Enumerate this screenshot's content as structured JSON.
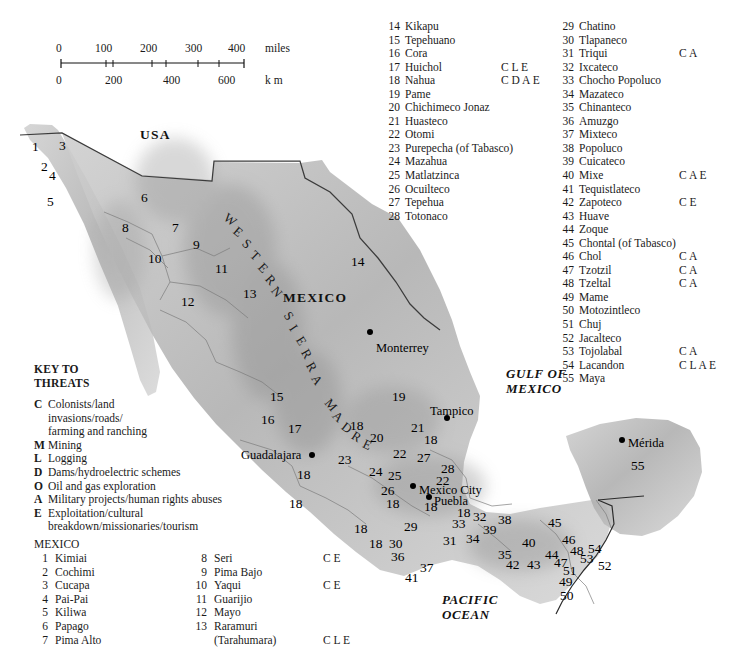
{
  "scale": {
    "miles_label": "miles",
    "km_label": "k m",
    "miles_ticks": [
      "0",
      "100",
      "200",
      "300",
      "400"
    ],
    "km_ticks": [
      "0",
      "200",
      "400",
      "600"
    ]
  },
  "threats_key": {
    "heading_line1": "KEY TO",
    "heading_line2": "THREATS",
    "items": [
      {
        "code": "C",
        "label": "Colonists/land",
        "cont": [
          "invasions/roads/",
          "farming and ranching"
        ]
      },
      {
        "code": "M",
        "label": "Mining",
        "cont": []
      },
      {
        "code": "L",
        "label": "Logging",
        "cont": []
      },
      {
        "code": "D",
        "label": "Dams/hydroelectric schemes",
        "cont": []
      },
      {
        "code": "O",
        "label": "Oil and gas exploration",
        "cont": []
      },
      {
        "code": "A",
        "label": "Military projects/human rights abuses",
        "cont": []
      },
      {
        "code": "E",
        "label": "Exploitation/cultural",
        "cont": [
          "breakdown/missionaries/tourism"
        ]
      }
    ]
  },
  "peoples": {
    "country_heading": "MEXICO",
    "col_bottom_left": [
      {
        "num": "1",
        "name": "Kimiai",
        "threats": ""
      },
      {
        "num": "2",
        "name": "Cochimi",
        "threats": ""
      },
      {
        "num": "3",
        "name": "Cucapa",
        "threats": ""
      },
      {
        "num": "4",
        "name": "Pai-Pai",
        "threats": ""
      },
      {
        "num": "5",
        "name": "Kiliwa",
        "threats": ""
      },
      {
        "num": "6",
        "name": "Papago",
        "threats": ""
      },
      {
        "num": "7",
        "name": "Pima Alto",
        "threats": ""
      }
    ],
    "col_bottom_mid": [
      {
        "num": "8",
        "name": "Seri",
        "threats": "C E"
      },
      {
        "num": "9",
        "name": "Pima Bajo",
        "threats": ""
      },
      {
        "num": "10",
        "name": "Yaqui",
        "threats": "C E"
      },
      {
        "num": "11",
        "name": "Guarijio",
        "threats": ""
      },
      {
        "num": "12",
        "name": "Mayo",
        "threats": ""
      },
      {
        "num": "13",
        "name": "Raramuri",
        "threats": ""
      },
      {
        "num": "",
        "name": "(Tarahumara)",
        "threats": "C L E"
      }
    ],
    "col_top_left": [
      {
        "num": "14",
        "name": "Kikapu",
        "threats": ""
      },
      {
        "num": "15",
        "name": "Tepehuano",
        "threats": ""
      },
      {
        "num": "16",
        "name": "Cora",
        "threats": ""
      },
      {
        "num": "17",
        "name": "Huichol",
        "threats": "C L E"
      },
      {
        "num": "18",
        "name": "Nahua",
        "threats": "C D A E"
      },
      {
        "num": "19",
        "name": "Pame",
        "threats": ""
      },
      {
        "num": "20",
        "name": "Chichimeco Jonaz",
        "threats": ""
      },
      {
        "num": "21",
        "name": "Huasteco",
        "threats": ""
      },
      {
        "num": "22",
        "name": "Otomi",
        "threats": ""
      },
      {
        "num": "23",
        "name": "Purepecha (of Tabasco)",
        "threats": ""
      },
      {
        "num": "24",
        "name": "Mazahua",
        "threats": ""
      },
      {
        "num": "25",
        "name": "Matlatzinca",
        "threats": ""
      },
      {
        "num": "26",
        "name": "Ocuilteco",
        "threats": ""
      },
      {
        "num": "27",
        "name": "Tepehua",
        "threats": ""
      },
      {
        "num": "28",
        "name": "Totonaco",
        "threats": ""
      }
    ],
    "col_top_right": [
      {
        "num": "29",
        "name": "Chatino",
        "threats": ""
      },
      {
        "num": "30",
        "name": "Tlapaneco",
        "threats": ""
      },
      {
        "num": "31",
        "name": "Triqui",
        "threats": "C A"
      },
      {
        "num": "32",
        "name": "Ixcateco",
        "threats": ""
      },
      {
        "num": "33",
        "name": "Chocho Popoluco",
        "threats": ""
      },
      {
        "num": "34",
        "name": "Mazateco",
        "threats": ""
      },
      {
        "num": "35",
        "name": "Chinanteco",
        "threats": ""
      },
      {
        "num": "36",
        "name": "Amuzgo",
        "threats": ""
      },
      {
        "num": "37",
        "name": "Mixteco",
        "threats": ""
      },
      {
        "num": "38",
        "name": "Popoluco",
        "threats": ""
      },
      {
        "num": "39",
        "name": "Cuicateco",
        "threats": ""
      },
      {
        "num": "40",
        "name": "Mixe",
        "threats": "C A E"
      },
      {
        "num": "41",
        "name": "Tequistlateco",
        "threats": ""
      },
      {
        "num": "42",
        "name": "Zapoteco",
        "threats": "C E"
      },
      {
        "num": "43",
        "name": "Huave",
        "threats": ""
      },
      {
        "num": "44",
        "name": "Zoque",
        "threats": ""
      },
      {
        "num": "45",
        "name": "Chontal (of Tabasco)",
        "threats": ""
      },
      {
        "num": "46",
        "name": "Chol",
        "threats": "C A"
      },
      {
        "num": "47",
        "name": "Tzotzil",
        "threats": "C A"
      },
      {
        "num": "48",
        "name": "Tzeltal",
        "threats": "C A"
      },
      {
        "num": "49",
        "name": "Mame",
        "threats": ""
      },
      {
        "num": "50",
        "name": "Motozintleco",
        "threats": ""
      },
      {
        "num": "51",
        "name": "Chuj",
        "threats": ""
      },
      {
        "num": "52",
        "name": "Jacalteco",
        "threats": ""
      },
      {
        "num": "53",
        "name": "Tojolabal",
        "threats": "C A"
      },
      {
        "num": "54",
        "name": "Lacandon",
        "threats": "C L A E"
      },
      {
        "num": "55",
        "name": "Maya",
        "threats": ""
      }
    ]
  },
  "map_labels": {
    "countries": [
      {
        "text": "USA",
        "x": 140,
        "y": 127
      },
      {
        "text": "MEXICO",
        "x": 283,
        "y": 290
      }
    ],
    "oceans": [
      {
        "line1": "GULF OF",
        "line2": "MEXICO",
        "x": 506,
        "y": 366
      },
      {
        "line1": "PACIFIC",
        "line2": "OCEAN",
        "x": 442,
        "y": 592
      }
    ],
    "range_name": "WESTERN SIERRA MADRE",
    "cities": [
      {
        "name": "Monterrey",
        "x": 376,
        "y": 341,
        "dot_x": 367,
        "dot_y": 329
      },
      {
        "name": "Tampico",
        "x": 430,
        "y": 404,
        "dot_x": 444,
        "dot_y": 415
      },
      {
        "name": "Guadalajara",
        "x": 241,
        "y": 448,
        "dot_x": 309,
        "dot_y": 452
      },
      {
        "name": "Mexico City",
        "x": 419,
        "y": 483,
        "dot_x": 410,
        "dot_y": 483
      },
      {
        "name": "Puebla",
        "x": 434,
        "y": 494,
        "dot_x": 426,
        "dot_y": 494
      },
      {
        "name": "Mérida",
        "x": 628,
        "y": 436,
        "dot_x": 619,
        "dot_y": 437
      }
    ],
    "numbers": [
      {
        "n": "1",
        "x": 32,
        "y": 139
      },
      {
        "n": "2",
        "x": 41,
        "y": 159
      },
      {
        "n": "3",
        "x": 59,
        "y": 138
      },
      {
        "n": "4",
        "x": 49,
        "y": 168
      },
      {
        "n": "5",
        "x": 47,
        "y": 194
      },
      {
        "n": "6",
        "x": 141,
        "y": 190
      },
      {
        "n": "7",
        "x": 172,
        "y": 220
      },
      {
        "n": "8",
        "x": 122,
        "y": 220
      },
      {
        "n": "9",
        "x": 193,
        "y": 237
      },
      {
        "n": "10",
        "x": 148,
        "y": 251
      },
      {
        "n": "11",
        "x": 215,
        "y": 261
      },
      {
        "n": "12",
        "x": 181,
        "y": 294
      },
      {
        "n": "13",
        "x": 243,
        "y": 286
      },
      {
        "n": "14",
        "x": 351,
        "y": 254
      },
      {
        "n": "15",
        "x": 270,
        "y": 389
      },
      {
        "n": "16",
        "x": 261,
        "y": 412
      },
      {
        "n": "17",
        "x": 288,
        "y": 421
      },
      {
        "n": "18",
        "x": 350,
        "y": 418
      },
      {
        "n": "19",
        "x": 392,
        "y": 389
      },
      {
        "n": "20",
        "x": 370,
        "y": 430
      },
      {
        "n": "21",
        "x": 411,
        "y": 420
      },
      {
        "n": "18",
        "x": 424,
        "y": 432
      },
      {
        "n": "22",
        "x": 393,
        "y": 446
      },
      {
        "n": "27",
        "x": 417,
        "y": 450
      },
      {
        "n": "23",
        "x": 338,
        "y": 452
      },
      {
        "n": "18",
        "x": 297,
        "y": 467
      },
      {
        "n": "24",
        "x": 369,
        "y": 464
      },
      {
        "n": "25",
        "x": 388,
        "y": 468
      },
      {
        "n": "28",
        "x": 441,
        "y": 461
      },
      {
        "n": "22",
        "x": 436,
        "y": 473
      },
      {
        "n": "26",
        "x": 381,
        "y": 483
      },
      {
        "n": "18",
        "x": 289,
        "y": 496
      },
      {
        "n": "18",
        "x": 386,
        "y": 496
      },
      {
        "n": "18",
        "x": 424,
        "y": 499
      },
      {
        "n": "18",
        "x": 457,
        "y": 505
      },
      {
        "n": "33",
        "x": 452,
        "y": 516
      },
      {
        "n": "32",
        "x": 473,
        "y": 509
      },
      {
        "n": "38",
        "x": 498,
        "y": 512
      },
      {
        "n": "39",
        "x": 483,
        "y": 522
      },
      {
        "n": "45",
        "x": 548,
        "y": 515
      },
      {
        "n": "18",
        "x": 354,
        "y": 521
      },
      {
        "n": "29",
        "x": 404,
        "y": 519
      },
      {
        "n": "31",
        "x": 443,
        "y": 533
      },
      {
        "n": "34",
        "x": 466,
        "y": 531
      },
      {
        "n": "46",
        "x": 562,
        "y": 532
      },
      {
        "n": "40",
        "x": 522,
        "y": 535
      },
      {
        "n": "18",
        "x": 369,
        "y": 536
      },
      {
        "n": "30",
        "x": 389,
        "y": 536
      },
      {
        "n": "35",
        "x": 498,
        "y": 547
      },
      {
        "n": "44",
        "x": 545,
        "y": 547
      },
      {
        "n": "48",
        "x": 570,
        "y": 543
      },
      {
        "n": "54",
        "x": 588,
        "y": 541
      },
      {
        "n": "36",
        "x": 391,
        "y": 549
      },
      {
        "n": "42",
        "x": 506,
        "y": 557
      },
      {
        "n": "43",
        "x": 527,
        "y": 557
      },
      {
        "n": "47",
        "x": 554,
        "y": 555
      },
      {
        "n": "53",
        "x": 580,
        "y": 551
      },
      {
        "n": "52",
        "x": 598,
        "y": 558
      },
      {
        "n": "37",
        "x": 420,
        "y": 560
      },
      {
        "n": "51",
        "x": 563,
        "y": 563
      },
      {
        "n": "41",
        "x": 405,
        "y": 570
      },
      {
        "n": "49",
        "x": 559,
        "y": 574
      },
      {
        "n": "50",
        "x": 560,
        "y": 588
      },
      {
        "n": "55",
        "x": 631,
        "y": 458
      }
    ]
  }
}
